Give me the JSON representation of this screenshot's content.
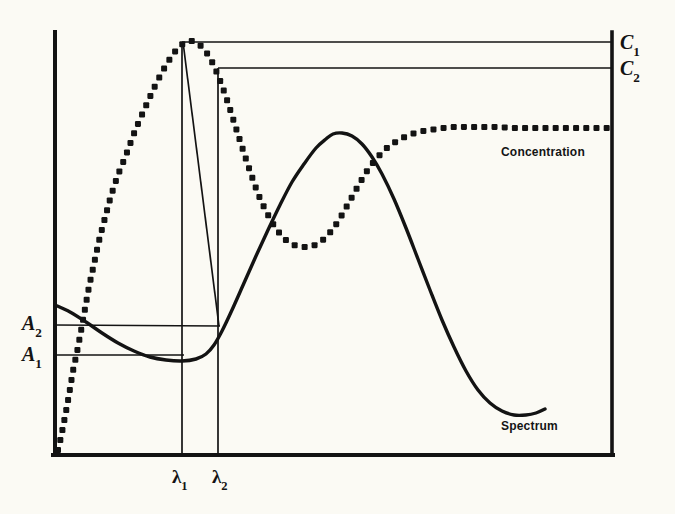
{
  "figure": {
    "kind": "line-plot",
    "background_color": "#fbfaf4",
    "ink_color": "#131313"
  },
  "labels": {
    "c1_base": "C",
    "c1_sub": "1",
    "c2_base": "C",
    "c2_sub": "2",
    "a1_base": "A",
    "a1_sub": "1",
    "a2_base": "A",
    "a2_sub": "2",
    "lambda1_base": "λ",
    "lambda1_sub": "1",
    "lambda2_base": "λ",
    "lambda2_sub": "2",
    "concentration": "Concentration",
    "spectrum": "Spectrum"
  },
  "chart_data": {
    "type": "line",
    "title": "",
    "xlabel": "",
    "ylabel": "",
    "grid": false,
    "legend": "inline-annotations",
    "axis_box": {
      "left": 55,
      "right": 612,
      "top": 32,
      "bottom": 455
    },
    "xlim": [
      55,
      612
    ],
    "ylim": [
      455,
      32
    ],
    "series": [
      {
        "name": "Spectrum",
        "style": "solid",
        "linewidth": 3.4,
        "label_position": [
          501,
          426
        ],
        "points": [
          [
            55,
            305
          ],
          [
            70,
            312
          ],
          [
            86,
            322
          ],
          [
            102,
            333
          ],
          [
            118,
            343
          ],
          [
            134,
            351
          ],
          [
            150,
            357
          ],
          [
            166,
            360
          ],
          [
            182,
            361
          ],
          [
            196,
            359
          ],
          [
            206,
            354
          ],
          [
            214,
            345
          ],
          [
            222,
            331
          ],
          [
            232,
            310
          ],
          [
            244,
            283
          ],
          [
            256,
            256
          ],
          [
            268,
            230
          ],
          [
            280,
            205
          ],
          [
            292,
            182
          ],
          [
            304,
            164
          ],
          [
            316,
            148
          ],
          [
            326,
            139
          ],
          [
            333,
            134
          ],
          [
            342,
            133
          ],
          [
            352,
            136
          ],
          [
            362,
            144
          ],
          [
            372,
            157
          ],
          [
            382,
            174
          ],
          [
            394,
            199
          ],
          [
            406,
            228
          ],
          [
            418,
            259
          ],
          [
            430,
            290
          ],
          [
            442,
            320
          ],
          [
            454,
            347
          ],
          [
            466,
            371
          ],
          [
            478,
            390
          ],
          [
            490,
            403
          ],
          [
            502,
            411
          ],
          [
            514,
            415
          ],
          [
            526,
            415
          ],
          [
            536,
            413
          ],
          [
            545,
            409
          ]
        ]
      },
      {
        "name": "Concentration",
        "style": "dotted",
        "dot_radius": 3.0,
        "label_position": [
          501,
          152
        ],
        "points": [
          [
            58,
            450
          ],
          [
            61,
            437
          ],
          [
            64,
            422
          ],
          [
            67,
            406
          ],
          [
            70,
            389
          ],
          [
            73,
            371
          ],
          [
            77,
            352
          ],
          [
            81,
            331
          ],
          [
            85,
            309
          ],
          [
            89,
            287
          ],
          [
            94,
            264
          ],
          [
            99,
            241
          ],
          [
            105,
            218
          ],
          [
            111,
            196
          ],
          [
            118,
            175
          ],
          [
            126,
            155
          ],
          [
            135,
            131
          ],
          [
            145,
            108
          ],
          [
            156,
            84
          ],
          [
            168,
            62
          ],
          [
            180,
            46
          ],
          [
            192,
            41
          ],
          [
            202,
            47
          ],
          [
            211,
            60
          ],
          [
            219,
            78
          ],
          [
            227,
            100
          ],
          [
            235,
            125
          ],
          [
            243,
            150
          ],
          [
            251,
            174
          ],
          [
            259,
            196
          ],
          [
            268,
            215
          ],
          [
            277,
            230
          ],
          [
            287,
            241
          ],
          [
            297,
            246
          ],
          [
            307,
            247
          ],
          [
            317,
            244
          ],
          [
            327,
            236
          ],
          [
            337,
            223
          ],
          [
            347,
            206
          ],
          [
            357,
            188
          ],
          [
            367,
            171
          ],
          [
            377,
            158
          ],
          [
            387,
            148
          ],
          [
            397,
            141
          ],
          [
            407,
            136
          ],
          [
            418,
            132
          ],
          [
            430,
            130
          ],
          [
            443,
            128
          ],
          [
            456,
            127
          ],
          [
            470,
            127
          ],
          [
            484,
            127
          ],
          [
            498,
            127
          ],
          [
            512,
            128
          ],
          [
            526,
            128
          ],
          [
            540,
            128
          ],
          [
            554,
            128
          ],
          [
            568,
            128
          ],
          [
            582,
            128
          ],
          [
            596,
            128
          ],
          [
            610,
            128
          ]
        ]
      }
    ],
    "guide_lines": [
      {
        "name": "c1-level",
        "orientation": "horizontal",
        "y": 42,
        "x_from": 182,
        "x_to": 612
      },
      {
        "name": "c2-level",
        "orientation": "horizontal",
        "y": 68,
        "x_from": 218,
        "x_to": 612
      },
      {
        "name": "a2-level",
        "orientation": "horizontal",
        "y": 325,
        "x_from": 55,
        "x_to": 219
      },
      {
        "name": "a1-level",
        "orientation": "horizontal",
        "y": 355,
        "x_from": 55,
        "x_to": 183
      },
      {
        "name": "lambda1-drop",
        "orientation": "vertical",
        "x": 182,
        "y_from": 42,
        "y_to": 455
      },
      {
        "name": "lambda2-drop",
        "orientation": "vertical",
        "x": 218,
        "y_from": 68,
        "y_to": 455
      },
      {
        "name": "c1-to-a2-diagonal",
        "orientation": "diagonal",
        "x_from": 183,
        "y_from": 42,
        "x_to": 219,
        "y_to": 326
      }
    ],
    "annotations": [
      {
        "name": "C1",
        "text": "C₁",
        "x": 620,
        "y": 44
      },
      {
        "name": "C2",
        "text": "C₂",
        "x": 620,
        "y": 70
      },
      {
        "name": "A2",
        "text": "A₂",
        "x": 24,
        "y": 325
      },
      {
        "name": "A1",
        "text": "A₁",
        "x": 24,
        "y": 357
      },
      {
        "name": "lambda1",
        "text": "λ₁",
        "x": 182,
        "y": 478
      },
      {
        "name": "lambda2",
        "text": "λ₂",
        "x": 222,
        "y": 478
      }
    ]
  }
}
